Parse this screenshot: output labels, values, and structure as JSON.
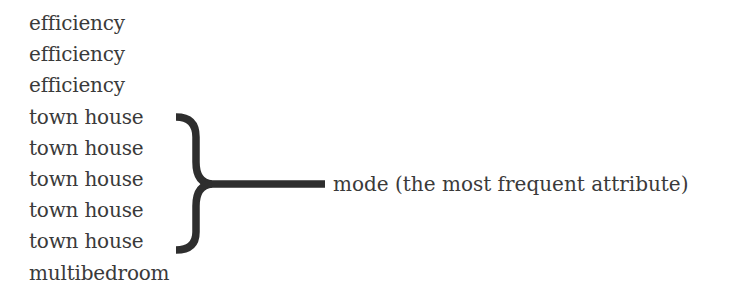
{
  "diagram": {
    "values": [
      "efficiency",
      "efficiency",
      "efficiency",
      "town house",
      "town house",
      "town house",
      "town house",
      "town house",
      "multibedroom"
    ],
    "bracket": {
      "groups_rows": [
        3,
        7
      ],
      "color": "#2e2e2e"
    },
    "annotation": "mode (the most frequent attribute)"
  }
}
